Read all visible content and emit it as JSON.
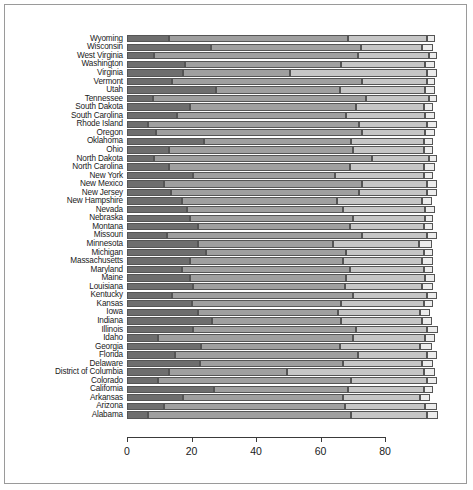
{
  "chart_data": {
    "type": "bar",
    "orientation": "horizontal",
    "stacked": true,
    "title": "",
    "xlabel": "",
    "ylabel": "",
    "xlim": [
      0,
      98
    ],
    "grid": false,
    "legend": "none",
    "axis_ticks": [
      "0",
      "20",
      "40",
      "60",
      "80"
    ],
    "axis_tick_values": [
      0,
      20,
      40,
      60,
      80
    ],
    "categories": [
      "Wyoming",
      "Wisconsin",
      "West Virginia",
      "Washington",
      "Virginia",
      "Vermont",
      "Utah",
      "Tennessee",
      "South Dakota",
      "South Carolina",
      "Rhode Island",
      "Oregon",
      "Oklahoma",
      "Ohio",
      "North Dakota",
      "North Carolina",
      "New York",
      "New Mexico",
      "New Jersey",
      "New Hampshire",
      "Nevada",
      "Nebraska",
      "Montana",
      "Missouri",
      "Minnesota",
      "Michigan",
      "Massachusetts",
      "Maryland",
      "Maine",
      "Louisiana",
      "Kentucky",
      "Kansas",
      "Iowa",
      "Indiana",
      "Illinois",
      "Idaho",
      "Georgia",
      "Florida",
      "Delaware",
      "District of Columbia",
      "Colorado",
      "California",
      "Arkansas",
      "Arizona",
      "Alabama"
    ],
    "series": [
      {
        "name": "segment-1",
        "color": "#6e6e6e",
        "values": [
          13.0,
          26.0,
          8.5,
          18.0,
          17.5,
          14.0,
          27.5,
          8.0,
          19.5,
          15.5,
          6.5,
          9.0,
          24.0,
          13.0,
          8.5,
          13.0,
          20.5,
          11.5,
          13.5,
          17.0,
          18.5,
          19.5,
          22.0,
          12.5,
          22.0,
          24.5,
          19.5,
          17.0,
          19.5,
          20.5,
          14.0,
          20.0,
          22.0,
          26.5,
          20.5,
          9.5,
          23.0,
          15.0,
          22.5,
          13.0,
          9.5,
          27.0,
          17.5,
          11.5,
          6.5
        ]
      },
      {
        "name": "segment-2",
        "color": "#9f9f9f",
        "values": [
          55.5,
          46.5,
          63.0,
          48.5,
          33.0,
          59.0,
          38.5,
          66.0,
          51.5,
          52.5,
          65.5,
          64.0,
          45.5,
          57.0,
          67.5,
          56.0,
          44.0,
          61.5,
          58.5,
          48.0,
          48.5,
          50.5,
          47.0,
          60.5,
          42.0,
          43.5,
          47.5,
          52.0,
          48.5,
          47.0,
          56.0,
          46.5,
          43.5,
          40.0,
          50.5,
          60.5,
          43.0,
          56.5,
          44.5,
          36.5,
          60.0,
          41.5,
          49.5,
          56.0,
          63.0
        ]
      },
      {
        "name": "segment-3",
        "color": "#c6c6c6",
        "values": [
          24.5,
          19.0,
          22.0,
          26.0,
          42.5,
          20.0,
          26.5,
          19.5,
          21.0,
          24.5,
          21.0,
          19.5,
          22.5,
          22.0,
          17.5,
          23.0,
          27.5,
          20.0,
          21.0,
          26.5,
          25.5,
          22.5,
          23.0,
          20.0,
          26.5,
          24.0,
          24.5,
          23.0,
          24.5,
          24.0,
          23.0,
          25.5,
          25.5,
          25.0,
          22.0,
          22.5,
          25.0,
          21.5,
          24.5,
          42.5,
          23.5,
          23.5,
          24.0,
          25.0,
          23.5
        ]
      },
      {
        "name": "segment-4",
        "color": "#ececec",
        "values": [
          2.5,
          3.5,
          2.5,
          3.0,
          3.0,
          2.5,
          3.0,
          2.5,
          3.0,
          3.0,
          3.0,
          3.0,
          3.0,
          3.0,
          2.5,
          3.5,
          3.0,
          3.0,
          3.0,
          3.0,
          3.0,
          2.5,
          3.0,
          3.0,
          4.0,
          3.0,
          3.5,
          3.0,
          3.0,
          3.5,
          3.0,
          3.0,
          3.0,
          3.0,
          3.5,
          3.0,
          3.5,
          3.0,
          3.5,
          3.5,
          3.0,
          3.0,
          3.0,
          3.5,
          3.5
        ]
      }
    ]
  }
}
